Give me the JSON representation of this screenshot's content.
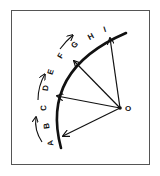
{
  "diagram": {
    "type": "radial-vectors-on-arc",
    "stroke_color": "#111111",
    "frame_color": "#555555",
    "center_label": "O",
    "arc_labels": [
      "A",
      "B",
      "C",
      "D",
      "E",
      "F",
      "G",
      "H",
      "I"
    ],
    "vectors_from_center_to": [
      "B",
      "D",
      "F",
      "I"
    ],
    "direction_arrows": 3,
    "direction": "counterclockwise (A toward I)"
  }
}
